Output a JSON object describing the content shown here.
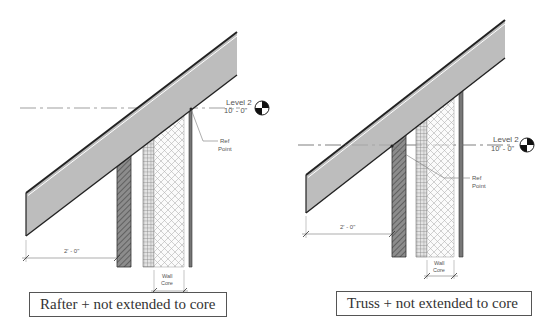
{
  "diagrams": [
    {
      "id": "rafter",
      "caption": "Rafter + not extended to core",
      "level": {
        "name": "Level 2",
        "elevation": "10' - 0\""
      },
      "ref_point": {
        "line1": "Ref",
        "line2": "Point"
      },
      "overhang_dimension": "2' - 0\"",
      "wall_core": {
        "line1": "Wall",
        "line2": "Core"
      }
    },
    {
      "id": "truss",
      "caption": "Truss + not extended to core",
      "level": {
        "name": "Level 2",
        "elevation": "10' - 0\""
      },
      "ref_point": {
        "line1": "Ref",
        "line2": "Point"
      },
      "overhang_dimension": "2' - 0\"",
      "wall_core": {
        "line1": "Wall",
        "line2": "Core"
      }
    }
  ],
  "colors": {
    "roof_fill": "#bdbdbd",
    "outline": "#222222",
    "hatch": "#666666",
    "grid": "#8a8a8a",
    "crosshatch": "#b8b8b8",
    "text": "#555555"
  }
}
